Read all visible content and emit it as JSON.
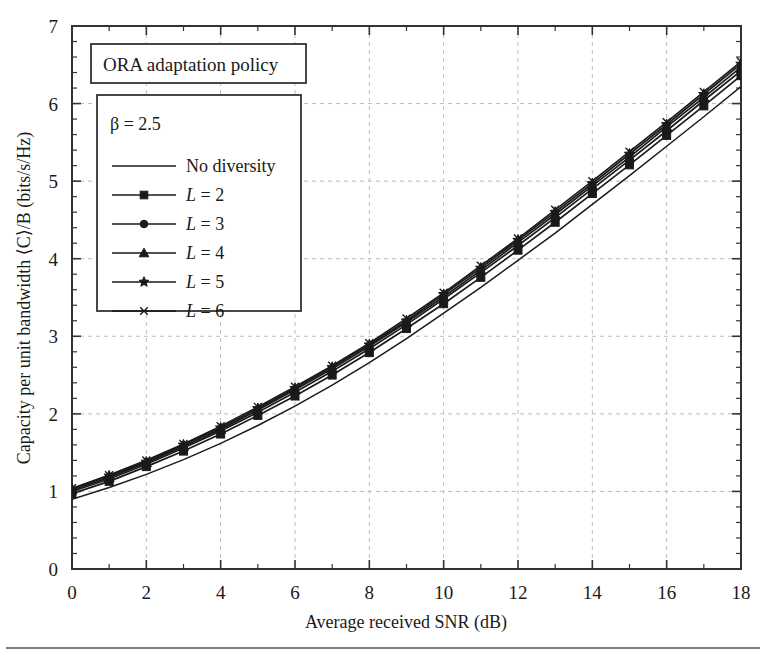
{
  "figure": {
    "title_box_label": "ORA adaptation policy",
    "footer_rule": true
  },
  "chart_data": {
    "type": "line",
    "title": "ORA adaptation policy",
    "xlabel": "Average received SNR (dB)",
    "ylabel": "Capacity per unit bandwidth ⟨C⟩/B (bits/s/Hz)",
    "xlim": [
      0,
      18
    ],
    "ylim": [
      0,
      7
    ],
    "xticks": [
      0,
      2,
      4,
      6,
      8,
      10,
      12,
      14,
      16,
      18
    ],
    "xtick_labels": [
      "0",
      "2",
      "4",
      "6",
      "8",
      "10",
      "12",
      "14",
      "16",
      "18"
    ],
    "yticks": [
      0,
      1,
      2,
      3,
      4,
      5,
      6,
      7
    ],
    "ytick_labels": [
      "0",
      "1",
      "2",
      "3",
      "4",
      "5",
      "6",
      "7"
    ],
    "x_minor_step": 1,
    "y_minor_step": 0.2,
    "grid": true,
    "grid_style": "dashed light gray at major ticks",
    "legend_position": "upper-left inside plot",
    "legend_annotation": "β = 2.5",
    "x": [
      0,
      1,
      2,
      3,
      4,
      5,
      6,
      7,
      8,
      9,
      10,
      11,
      12,
      13,
      14,
      15,
      16,
      17,
      18
    ],
    "series": [
      {
        "name": "No diversity",
        "label": "No diversity",
        "marker": "none",
        "values": [
          0.9,
          1.05,
          1.22,
          1.41,
          1.62,
          1.85,
          2.1,
          2.37,
          2.66,
          2.97,
          3.3,
          3.63,
          3.98,
          4.33,
          4.7,
          5.07,
          5.45,
          5.83,
          6.22
        ]
      },
      {
        "name": "L = 2",
        "label": "L = 2",
        "label_italic_prefix": "L",
        "marker": "square",
        "values": [
          0.97,
          1.13,
          1.32,
          1.52,
          1.74,
          1.98,
          2.23,
          2.5,
          2.79,
          3.1,
          3.42,
          3.76,
          4.11,
          4.47,
          4.84,
          5.21,
          5.59,
          5.97,
          6.36
        ]
      },
      {
        "name": "L = 3",
        "label": "L = 3",
        "label_italic_prefix": "L",
        "marker": "circle",
        "values": [
          1.0,
          1.16,
          1.35,
          1.56,
          1.78,
          2.02,
          2.28,
          2.55,
          2.84,
          3.15,
          3.48,
          3.82,
          4.17,
          4.53,
          4.9,
          5.27,
          5.65,
          6.04,
          6.42
        ]
      },
      {
        "name": "L = 4",
        "label": "L = 4",
        "label_italic_prefix": "L",
        "marker": "triangle",
        "values": [
          1.02,
          1.18,
          1.37,
          1.58,
          1.8,
          2.05,
          2.31,
          2.58,
          2.87,
          3.18,
          3.51,
          3.85,
          4.21,
          4.57,
          4.94,
          5.31,
          5.7,
          6.08,
          6.47
        ]
      },
      {
        "name": "L = 5",
        "label": "L = 5",
        "label_italic_prefix": "L",
        "marker": "star",
        "values": [
          1.03,
          1.2,
          1.38,
          1.6,
          1.82,
          2.07,
          2.33,
          2.6,
          2.89,
          3.2,
          3.54,
          3.88,
          4.24,
          4.6,
          4.97,
          5.35,
          5.73,
          6.12,
          6.51
        ]
      },
      {
        "name": "L = 6",
        "label": "L = 6",
        "label_italic_prefix": "L",
        "marker": "x",
        "values": [
          1.04,
          1.21,
          1.4,
          1.61,
          1.84,
          2.09,
          2.35,
          2.62,
          2.91,
          3.23,
          3.56,
          3.91,
          4.26,
          4.63,
          5.0,
          5.38,
          5.76,
          6.15,
          6.54
        ]
      }
    ]
  }
}
